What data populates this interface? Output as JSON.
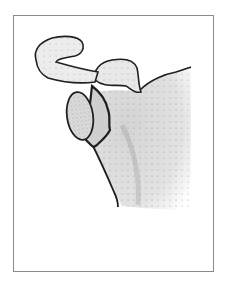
{
  "figure": {
    "colors": {
      "outline": "#1f1f1f",
      "frame": "#8a8a8a",
      "bone_fill": "#e6e6e6",
      "stipple": "#7a7a7a",
      "background": "#ffffff"
    }
  }
}
